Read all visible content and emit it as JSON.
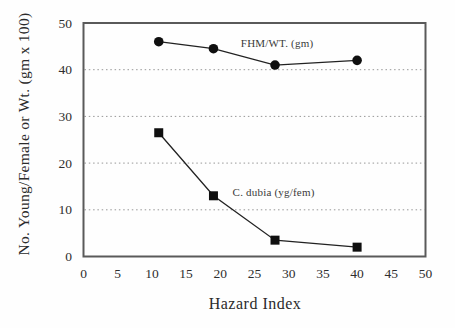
{
  "chart_data": {
    "type": "line",
    "x": [
      11,
      19,
      28,
      40
    ],
    "series": [
      {
        "name": "FHM/WT. (gm)",
        "marker": "circle",
        "values": [
          46,
          44.5,
          41,
          42
        ]
      },
      {
        "name": "C. dubia (yg/fem)",
        "marker": "square",
        "values": [
          26.5,
          13,
          3.5,
          2
        ]
      }
    ],
    "title": "",
    "xlabel": "Hazard Index",
    "ylabel": "No. Young/Female or Wt. (gm x 100)",
    "xlim": [
      0,
      50
    ],
    "ylim": [
      0,
      50
    ],
    "xticks": [
      0,
      5,
      10,
      15,
      20,
      25,
      30,
      35,
      40,
      45,
      50
    ],
    "yticks": [
      0,
      10,
      20,
      30,
      40,
      50
    ],
    "grid": {
      "y_values": [
        10,
        20,
        30,
        40
      ],
      "style": "dotted",
      "color": "#989898",
      "x_grid": false
    },
    "legend_position": "inline-annotations",
    "annotations": [
      {
        "text": "FHM/WT. (gm)",
        "x": 23.0,
        "y": 47.0
      },
      {
        "text": "C. dubia (yg/fem)",
        "x": 21.8,
        "y": 15.1
      }
    ],
    "colors": {
      "axis_frame": "#5a5a5a",
      "line": "#222222",
      "marker": "#0f0f0f",
      "background": "#fefefe",
      "text": "#2b2b2b"
    }
  }
}
